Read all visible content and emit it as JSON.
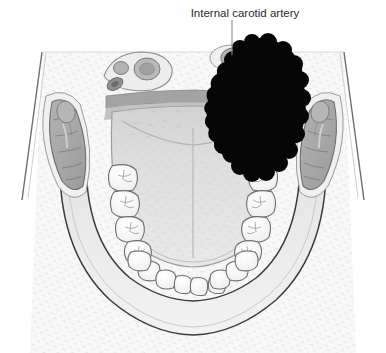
{
  "figure": {
    "type": "anatomical-illustration",
    "view": "axial-cross-section-oral-cavity",
    "background_color": "#ffffff"
  },
  "annotations": [
    {
      "id": "internal-carotid-artery",
      "label": "Internal carotid artery",
      "text_x": 245,
      "text_y": 13,
      "leader_from_x": 232,
      "leader_from_y": 20,
      "leader_to_x": 232,
      "leader_to_y": 55,
      "text_color": "#2b2b2b",
      "leader_color": "#8c8c8c"
    }
  ],
  "structures": {
    "tumor": {
      "name": "Tumor mass",
      "color": "#050505",
      "center_x": 266,
      "center_y": 106
    },
    "tongue": {
      "name": "Tongue",
      "color": "#dcdcdc",
      "outline_color": "#9a9a9a"
    },
    "teeth": {
      "name": "Dental arch",
      "color": "#fbfbfb",
      "outline_color": "#6e6e6e",
      "molars_per_side": 4,
      "anterior_teeth": 8
    },
    "pterygoid_left": {
      "name": "Left medial pterygoid muscle",
      "color": "#a8a8a8",
      "outline_color": "#6f6f6f"
    },
    "pterygoid_right": {
      "name": "Right medial pterygoid muscle",
      "color": "#a8a8a8",
      "outline_color": "#6f6f6f"
    },
    "neurovascular_left": {
      "name": "Left neurovascular bundle",
      "color": "#e8e8e8",
      "outline_color": "#8d8d8d",
      "vessel_count": 3
    },
    "carotid_right": {
      "name": "Right internal carotid artery",
      "color": "#b4b4b4",
      "outline_color": "#7a7a7a"
    },
    "mandible": {
      "name": "Mandible",
      "color": "#ededed",
      "outline_color": "#3a3a3a"
    },
    "soft_tissue": {
      "name": "Surrounding soft tissue",
      "color": "#f7f7f7",
      "stipple_color": "#d9d9d9"
    },
    "pharyngeal_band": {
      "name": "Posterior pharyngeal wall",
      "color": "#9e9e9e"
    }
  }
}
